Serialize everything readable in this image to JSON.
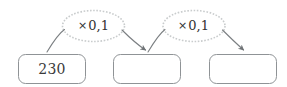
{
  "diagram": {
    "type": "function-machine",
    "title": "",
    "colors": {
      "box_stroke": "#8f9396",
      "ellipse_stroke": "#c9cccd",
      "arrow_stroke": "#7b7f82",
      "text": "#3a3a3a",
      "background": "#ffffff"
    },
    "boxes": [
      {
        "id": "box-1",
        "value": "230",
        "empty": false
      },
      {
        "id": "box-2",
        "value": "",
        "empty": true
      },
      {
        "id": "box-3",
        "value": "",
        "empty": true
      }
    ],
    "operations": [
      {
        "id": "op-1",
        "symbol": "×",
        "operand": "0,1",
        "label": "× 0,1"
      },
      {
        "id": "op-2",
        "symbol": "×",
        "operand": "0,1",
        "label": "× 0,1"
      }
    ],
    "arrows": [
      {
        "id": "arrow-1",
        "from": "box-1",
        "to": "op-1"
      },
      {
        "id": "arrow-2",
        "from": "op-1",
        "to": "box-2"
      },
      {
        "id": "arrow-3",
        "from": "box-2",
        "to": "op-2"
      },
      {
        "id": "arrow-4",
        "from": "op-2",
        "to": "box-3"
      }
    ]
  }
}
